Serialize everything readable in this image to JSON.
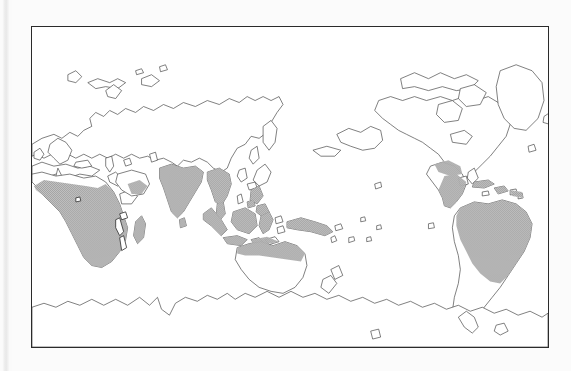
{
  "figure": {
    "kind": "map",
    "type": "world-distribution-map",
    "projection": "pacific-centred cylindrical",
    "title": "",
    "caption": "",
    "frame": {
      "x": 31,
      "y": 26,
      "width": 518,
      "height": 322,
      "border_color": "#2b2b2b"
    },
    "background_color": "#fbfbfb",
    "plate_color": "#ffffff",
    "coastline_color": "#4a4a4a",
    "shading_color": "#b4b4b4",
    "shading_legend_label": "shaded = distribution range"
  },
  "map": {
    "centre_meridian_label": "180° (Pacific-centred)",
    "shaded_regions": [
      {
        "name": "sub-saharan-africa",
        "label": "Sub-Saharan Africa"
      },
      {
        "name": "madagascar",
        "label": "Madagascar"
      },
      {
        "name": "arabian-southwest",
        "label": "Southwest Arabia"
      },
      {
        "name": "south-asia",
        "label": "Indian subcontinent"
      },
      {
        "name": "sri-lanka",
        "label": "Sri Lanka"
      },
      {
        "name": "indochina",
        "label": "Indochina / Southeast Asia"
      },
      {
        "name": "sumatra",
        "label": "Sumatra"
      },
      {
        "name": "java",
        "label": "Java"
      },
      {
        "name": "borneo",
        "label": "Borneo"
      },
      {
        "name": "sulawesi",
        "label": "Sulawesi"
      },
      {
        "name": "philippines",
        "label": "Philippines"
      },
      {
        "name": "new-guinea",
        "label": "New Guinea"
      },
      {
        "name": "northern-australia",
        "label": "Northern Australia"
      },
      {
        "name": "southern-mexico",
        "label": "Southern Mexico"
      },
      {
        "name": "central-america",
        "label": "Central America"
      },
      {
        "name": "caribbean",
        "label": "Caribbean islands"
      },
      {
        "name": "amazonia",
        "label": "Amazonia / northern South America"
      }
    ],
    "unshaded_regions": [
      {
        "name": "north-america",
        "label": "North America"
      },
      {
        "name": "greenland",
        "label": "Greenland"
      },
      {
        "name": "europe",
        "label": "Europe"
      },
      {
        "name": "north-africa-sahara",
        "label": "Sahara / North Africa"
      },
      {
        "name": "siberia",
        "label": "Siberia"
      },
      {
        "name": "east-asia",
        "label": "East Asia"
      },
      {
        "name": "japan",
        "label": "Japan"
      },
      {
        "name": "southern-australia",
        "label": "Southern Australia"
      },
      {
        "name": "new-zealand",
        "label": "New Zealand"
      },
      {
        "name": "southern-south-america",
        "label": "Southern South America"
      },
      {
        "name": "antarctica",
        "label": "Antarctica"
      }
    ]
  }
}
